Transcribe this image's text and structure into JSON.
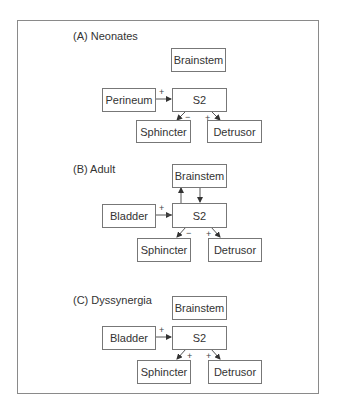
{
  "panels": [
    {
      "label": "(A)  Neonates",
      "nodes": {
        "brainstem": "Brainstem",
        "input": "Perineum",
        "center": "S2",
        "left_out": "Sphincter",
        "right_out": "Detrusor"
      },
      "signs": {
        "input_to_s2": "+",
        "s2_to_sphincter": "−",
        "s2_to_detrusor": "+"
      },
      "brainstem_connected": false
    },
    {
      "label": "(B)  Adult",
      "nodes": {
        "brainstem": "Brainstem",
        "input": "Bladder",
        "center": "S2",
        "left_out": "Sphincter",
        "right_out": "Detrusor"
      },
      "signs": {
        "input_to_s2": "+",
        "s2_to_sphincter": "−",
        "s2_to_detrusor": "+"
      },
      "brainstem_connected": true
    },
    {
      "label": "(C)  Dyssynergia",
      "nodes": {
        "brainstem": "Brainstem",
        "input": "Bladder",
        "center": "S2",
        "left_out": "Sphincter",
        "right_out": "Detrusor"
      },
      "signs": {
        "input_to_s2": "+",
        "s2_to_sphincter": "+",
        "s2_to_detrusor": "+"
      },
      "brainstem_connected": false
    }
  ],
  "colors": {
    "line": "#555555",
    "border": "#777777",
    "frame": "#8a8a8a"
  }
}
